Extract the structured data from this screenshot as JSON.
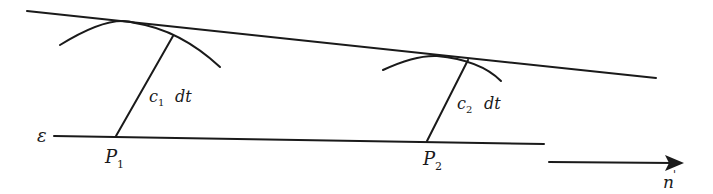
{
  "diagram": {
    "type": "wavefront-huygens-construction",
    "labels": {
      "epsilon": "ε",
      "p1_main": "P",
      "p1_sub": "1",
      "p2_main": "P",
      "p2_sub": "2",
      "c1_main": "c",
      "c1_sub": "1",
      "c1_dt": "dt",
      "c2_main": "c",
      "c2_sub": "2",
      "c2_dt": "dt",
      "normal_main": "n",
      "normal_prime": "'"
    },
    "colors": {
      "ink": "#1a1a1a",
      "background": "#ffffff"
    }
  }
}
